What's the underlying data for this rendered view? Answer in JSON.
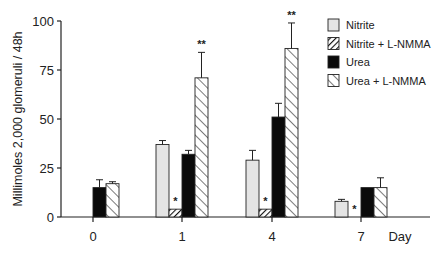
{
  "chart_data": {
    "type": "bar",
    "title": "",
    "xlabel": "Day",
    "ylabel": "Millimoles 2,000 glomeruli / 48h",
    "ylim": [
      0,
      100
    ],
    "yticks": [
      0,
      25,
      50,
      75,
      100
    ],
    "grid": false,
    "legend_position": "top-right",
    "categories": [
      "0",
      "1",
      "4",
      "7"
    ],
    "series": [
      {
        "name": "Nitrite",
        "pattern": "light-gray",
        "values": [
          null,
          37,
          29,
          8
        ],
        "errors": [
          null,
          2,
          5,
          1
        ],
        "significance": [
          "",
          "",
          "",
          ""
        ]
      },
      {
        "name": "Nitrite + L-NMMA",
        "pattern": "dense-hatch",
        "values": [
          null,
          4,
          4,
          0
        ],
        "errors": [
          null,
          0.5,
          0.5,
          0
        ],
        "significance": [
          "",
          "*",
          "*",
          "*"
        ]
      },
      {
        "name": "Urea",
        "pattern": "solid-black",
        "values": [
          15,
          32,
          51,
          15
        ],
        "errors": [
          4,
          2,
          7,
          0
        ],
        "significance": [
          "",
          "",
          "",
          ""
        ]
      },
      {
        "name": "Urea + L-NMMA",
        "pattern": "sparse-hatch",
        "values": [
          17,
          71,
          86,
          15
        ],
        "errors": [
          1,
          13,
          13,
          5
        ],
        "significance": [
          "",
          "**",
          "**",
          ""
        ]
      }
    ]
  }
}
